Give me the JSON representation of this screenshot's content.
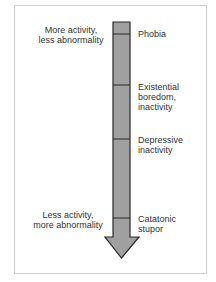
{
  "diagram": {
    "axis_labels": {
      "top": [
        "More activity,",
        "less abnormality"
      ],
      "bottom": [
        "Less activity,",
        "more abnormality"
      ]
    },
    "segments": [
      {
        "label": [
          "Phobia"
        ]
      },
      {
        "label": [
          "Existential",
          "boredom,",
          "inactivity"
        ]
      },
      {
        "label": [
          "Depressive",
          "inactivity"
        ]
      },
      {
        "label": [
          "Catatonic",
          "stupor"
        ]
      }
    ],
    "colors": {
      "arrow_fill": "#a0a0a0",
      "arrow_stroke": "#2a2a2a",
      "frame": "#cfcfcf",
      "text": "#333333"
    }
  }
}
